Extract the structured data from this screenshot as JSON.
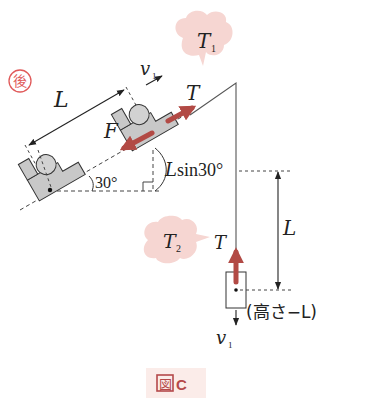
{
  "stamp": {
    "char": "後",
    "color": "#e05a5a"
  },
  "bubbles": {
    "t1": {
      "label": "T",
      "sub": "1"
    },
    "t2": {
      "label": "T",
      "sub": "2"
    },
    "fill": "#f6d6d2"
  },
  "labels": {
    "length_slope": "L",
    "velocity_slope": "v",
    "velocity_slope_sub": "1",
    "tension_slope": "T",
    "force": "F",
    "angle": "30°",
    "height": "Lsin30°",
    "tension_hanging": "T",
    "length_vertical": "L",
    "height_note": "(高さ−L)",
    "velocity_down": "v",
    "velocity_down_sub": "1"
  },
  "figure_caption": {
    "kanji": "図",
    "letter": "C",
    "color": "#b5494a",
    "bg": "#fbece9"
  },
  "colors": {
    "block": "#c8c8c8",
    "ball": "#d2d2d2",
    "force_arrow": "#b24a45",
    "line": "#333333"
  }
}
